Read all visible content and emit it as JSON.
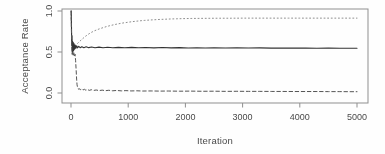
{
  "figure": {
    "xlabel": "Iteration",
    "ylabel": "Acceptance Rate"
  },
  "chart_data": {
    "type": "line",
    "title": "",
    "xlabel": "Iteration",
    "ylabel": "Acceptance Rate",
    "xlim": [
      0,
      5000
    ],
    "ylim": [
      0,
      1
    ],
    "x_ticks": [
      0,
      1000,
      2000,
      3000,
      4000,
      5000
    ],
    "x_tick_labels": [
      "0",
      "1000",
      "2000",
      "3000",
      "4000",
      "5000"
    ],
    "y_ticks": [
      0.0,
      0.5,
      1.0
    ],
    "y_tick_labels": [
      "0.0",
      "0.5",
      "1.0"
    ],
    "grid": false,
    "legend": "none",
    "frame_color": "#8f8f8f",
    "series": [
      {
        "name": "upper-acceptance-dotted",
        "style": "dotted",
        "color": "#8f8f8f",
        "width": 1,
        "points": [
          [
            3,
            1.0
          ],
          [
            10,
            0.72
          ],
          [
            18,
            0.55
          ],
          [
            30,
            0.52
          ],
          [
            45,
            0.57
          ],
          [
            60,
            0.555
          ],
          [
            80,
            0.575
          ],
          [
            100,
            0.595
          ],
          [
            130,
            0.615
          ],
          [
            160,
            0.635
          ],
          [
            200,
            0.66
          ],
          [
            250,
            0.69
          ],
          [
            300,
            0.715
          ],
          [
            350,
            0.737
          ],
          [
            400,
            0.755
          ],
          [
            450,
            0.77
          ],
          [
            500,
            0.783
          ],
          [
            560,
            0.797
          ],
          [
            620,
            0.81
          ],
          [
            680,
            0.821
          ],
          [
            740,
            0.831
          ],
          [
            800,
            0.84
          ],
          [
            860,
            0.848
          ],
          [
            920,
            0.855
          ],
          [
            980,
            0.861
          ],
          [
            1050,
            0.868
          ],
          [
            1120,
            0.874
          ],
          [
            1200,
            0.88
          ],
          [
            1280,
            0.885
          ],
          [
            1360,
            0.889
          ],
          [
            1450,
            0.893
          ],
          [
            1550,
            0.897
          ],
          [
            1650,
            0.9
          ],
          [
            1750,
            0.903
          ],
          [
            1850,
            0.905
          ],
          [
            1950,
            0.907
          ],
          [
            2100,
            0.909
          ],
          [
            2250,
            0.91
          ],
          [
            2400,
            0.911
          ],
          [
            2600,
            0.912
          ],
          [
            2800,
            0.912
          ],
          [
            3000,
            0.913
          ],
          [
            3200,
            0.913
          ],
          [
            3400,
            0.913
          ],
          [
            3600,
            0.913
          ],
          [
            3800,
            0.913
          ],
          [
            4000,
            0.913
          ],
          [
            4200,
            0.913
          ],
          [
            4400,
            0.913
          ],
          [
            4600,
            0.913
          ],
          [
            4800,
            0.913
          ],
          [
            5000,
            0.913
          ]
        ]
      },
      {
        "name": "middle-acceptance-solid",
        "style": "solid",
        "color": "#333333",
        "width": 1.1,
        "points": [
          [
            3,
            1.0
          ],
          [
            8,
            0.82
          ],
          [
            13,
            0.58
          ],
          [
            18,
            0.7
          ],
          [
            23,
            0.48
          ],
          [
            28,
            0.63
          ],
          [
            34,
            0.5
          ],
          [
            40,
            0.615
          ],
          [
            47,
            0.52
          ],
          [
            55,
            0.6
          ],
          [
            64,
            0.535
          ],
          [
            74,
            0.585
          ],
          [
            85,
            0.545
          ],
          [
            100,
            0.575
          ],
          [
            115,
            0.55
          ],
          [
            135,
            0.57
          ],
          [
            160,
            0.552
          ],
          [
            190,
            0.565
          ],
          [
            225,
            0.553
          ],
          [
            265,
            0.563
          ],
          [
            310,
            0.553
          ],
          [
            360,
            0.56
          ],
          [
            420,
            0.552
          ],
          [
            490,
            0.559
          ],
          [
            560,
            0.551
          ],
          [
            640,
            0.558
          ],
          [
            730,
            0.552
          ],
          [
            830,
            0.557
          ],
          [
            940,
            0.551
          ],
          [
            1060,
            0.556
          ],
          [
            1180,
            0.551
          ],
          [
            1300,
            0.555
          ],
          [
            1450,
            0.55
          ],
          [
            1600,
            0.554
          ],
          [
            1750,
            0.55
          ],
          [
            1900,
            0.553
          ],
          [
            2050,
            0.549
          ],
          [
            2200,
            0.552
          ],
          [
            2350,
            0.549
          ],
          [
            2500,
            0.551
          ],
          [
            2700,
            0.548
          ],
          [
            2900,
            0.551
          ],
          [
            3100,
            0.548
          ],
          [
            3300,
            0.55
          ],
          [
            3500,
            0.547
          ],
          [
            3700,
            0.549
          ],
          [
            3900,
            0.547
          ],
          [
            4100,
            0.548
          ],
          [
            4300,
            0.546
          ],
          [
            4500,
            0.547
          ],
          [
            4700,
            0.545
          ],
          [
            4850,
            0.546
          ],
          [
            5000,
            0.545
          ]
        ]
      },
      {
        "name": "lower-acceptance-dashed",
        "style": "dashed",
        "color": "#555555",
        "width": 1,
        "points": [
          [
            3,
            1.0
          ],
          [
            9,
            0.7
          ],
          [
            15,
            0.52
          ],
          [
            22,
            0.47
          ],
          [
            30,
            0.5
          ],
          [
            40,
            0.46
          ],
          [
            50,
            0.49
          ],
          [
            60,
            0.455
          ],
          [
            70,
            0.475
          ],
          [
            80,
            0.4
          ],
          [
            90,
            0.28
          ],
          [
            98,
            0.17
          ],
          [
            106,
            0.1
          ],
          [
            115,
            0.068
          ],
          [
            125,
            0.052
          ],
          [
            140,
            0.044
          ],
          [
            155,
            0.052
          ],
          [
            170,
            0.04
          ],
          [
            190,
            0.048
          ],
          [
            210,
            0.037
          ],
          [
            235,
            0.045
          ],
          [
            260,
            0.034
          ],
          [
            290,
            0.042
          ],
          [
            320,
            0.032
          ],
          [
            355,
            0.04
          ],
          [
            395,
            0.031
          ],
          [
            440,
            0.037
          ],
          [
            490,
            0.029
          ],
          [
            545,
            0.035
          ],
          [
            600,
            0.028
          ],
          [
            660,
            0.033
          ],
          [
            730,
            0.027
          ],
          [
            800,
            0.031
          ],
          [
            880,
            0.026
          ],
          [
            960,
            0.029
          ],
          [
            1050,
            0.025
          ],
          [
            1150,
            0.027
          ],
          [
            1250,
            0.024
          ],
          [
            1400,
            0.025
          ],
          [
            1550,
            0.023
          ],
          [
            1700,
            0.024
          ],
          [
            1900,
            0.022
          ],
          [
            2100,
            0.023
          ],
          [
            2300,
            0.021
          ],
          [
            2500,
            0.022
          ],
          [
            2700,
            0.02
          ],
          [
            2900,
            0.021
          ],
          [
            3100,
            0.02
          ],
          [
            3300,
            0.02
          ],
          [
            3500,
            0.019
          ],
          [
            3700,
            0.019
          ],
          [
            3900,
            0.018
          ],
          [
            4100,
            0.018
          ],
          [
            4300,
            0.018
          ],
          [
            4500,
            0.017
          ],
          [
            4700,
            0.017
          ],
          [
            4850,
            0.016
          ],
          [
            5000,
            0.016
          ]
        ]
      }
    ]
  }
}
